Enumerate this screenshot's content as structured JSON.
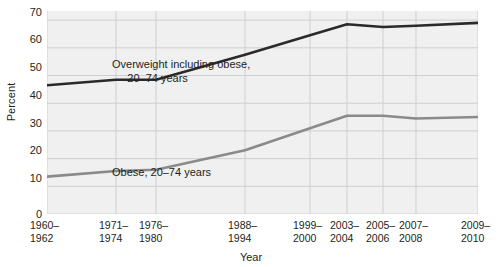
{
  "chart_data": {
    "type": "line",
    "title": "",
    "xlabel": "Year",
    "ylabel": "Percent",
    "ylim": [
      0,
      73.3
    ],
    "yticks": [
      0,
      10,
      20,
      30,
      40,
      50,
      60,
      70
    ],
    "ytick_labels": [
      "0",
      "10",
      "20",
      "30",
      "40",
      "50",
      "60",
      "70"
    ],
    "grid": true,
    "legend_position": "inline-annotations",
    "categories": [
      "1960–\n1962",
      "1971–\n1974",
      "1976–\n1980",
      "1988–\n1994",
      "1999–\n2000",
      "2003–\n2004",
      "2005–\n2006",
      "2007–\n2008",
      "2009–\n2010"
    ],
    "category_labels_line1": [
      "1960–",
      "1971–",
      "1976–",
      "1988–",
      "1999–",
      "2003–",
      "2005–",
      "2007–",
      "2009–"
    ],
    "category_labels_line2": [
      "1962",
      "1974",
      "1980",
      "1994",
      "2000",
      "2004",
      "2006",
      "2008",
      "2010"
    ],
    "x_positions_px": [
      47,
      116,
      156,
      245,
      310,
      347,
      383,
      416,
      478
    ],
    "series": [
      {
        "name": "Overweight including obese, 20–74 years",
        "color": "#2a2a2a",
        "values": [
          46.5,
          48.5,
          48.5,
          57.5,
          64.5,
          68.5,
          67.5,
          68.0,
          69.0
        ]
      },
      {
        "name": "Obese, 20–74 years",
        "color": "#8a8a8a",
        "values": [
          13.5,
          15.5,
          16.0,
          23.0,
          31.0,
          35.5,
          35.5,
          34.5,
          35.0
        ]
      }
    ],
    "annotations": [
      {
        "id": "overweight",
        "line1": "Overweight including obese,",
        "line2": "     20–74 years"
      },
      {
        "id": "obese",
        "line1": "Obese, 20–74 years",
        "line2": ""
      }
    ],
    "colors": {
      "plot_background": "#f0f0f0",
      "gridline": "#cfcfcf",
      "text": "#231f20",
      "series_overweight": "#2a2a2a",
      "series_obese": "#8a8a8a"
    }
  }
}
